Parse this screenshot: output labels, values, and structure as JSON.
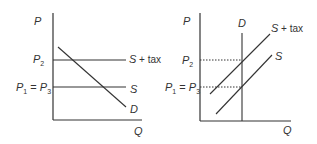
{
  "diagram": {
    "left": {
      "y_axis_label": "P",
      "x_axis_label": "Q",
      "price_labels": {
        "p2": {
          "main": "P",
          "sub": "2"
        },
        "p1": {
          "main": "P",
          "sub": "1"
        },
        "eq": " = ",
        "p3": {
          "main": "P",
          "sub": "3"
        }
      },
      "curves": {
        "s_tax": "S",
        "s_tax_suffix": " + tax",
        "s": "S",
        "d": "D"
      }
    },
    "right": {
      "y_axis_label": "P",
      "x_axis_label": "Q",
      "price_labels": {
        "p2": {
          "main": "P",
          "sub": "2"
        },
        "p1": {
          "main": "P",
          "sub": "1"
        },
        "eq": " = ",
        "p3": {
          "main": "P",
          "sub": "3"
        }
      },
      "curves": {
        "s_tax": "S",
        "s_tax_suffix": " + tax",
        "s": "S",
        "d": "D"
      }
    }
  }
}
